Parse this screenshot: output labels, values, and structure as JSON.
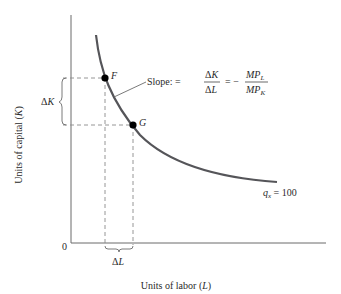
{
  "diagram": {
    "type": "isoquant",
    "colors": {
      "curve": "#555559",
      "axis": "#6b6b6b",
      "dashed": "#8a8a8a",
      "point": "#000000",
      "text": "#2a2a2a"
    },
    "axes": {
      "x_label_main": "Units of labor (",
      "x_label_var": "L",
      "x_label_close": ")",
      "y_label_main": "Units of capital (",
      "y_label_var": "K",
      "y_label_close": ")",
      "origin": "0"
    },
    "points": [
      {
        "id": "F",
        "label": "F"
      },
      {
        "id": "G",
        "label": "G"
      }
    ],
    "curve_label": {
      "var": "q",
      "sub": "x",
      "rest": " = 100"
    },
    "delta_k": {
      "delta": "Δ",
      "var": "K"
    },
    "delta_l": {
      "delta": "Δ",
      "var": "L"
    },
    "slope": {
      "prefix": "Slope: =",
      "frac1_num": "ΔK",
      "frac1_den": "ΔL",
      "eq": "= −",
      "frac2_num_main": "MP",
      "frac2_num_sub": "L",
      "frac2_den_main": "MP",
      "frac2_den_sub": "K"
    }
  }
}
